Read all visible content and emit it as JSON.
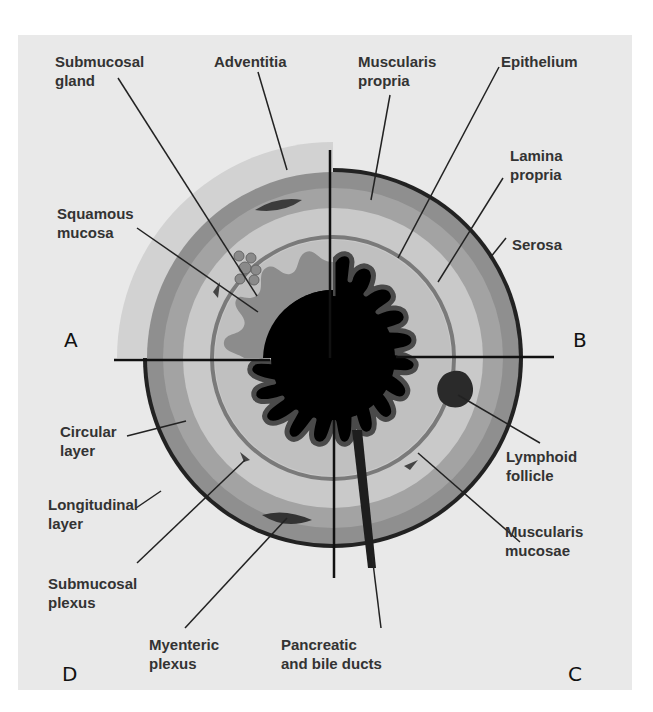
{
  "figure": {
    "quadrants": {
      "A": {
        "label": "A"
      },
      "B": {
        "label": "B"
      },
      "C": {
        "label": "C"
      },
      "D": {
        "label": "D"
      }
    },
    "labels": {
      "submucosal_gland": "Submucosal\ngland",
      "adventitia": "Adventitia",
      "muscularis_propria": "Muscularis\npropria",
      "epithelium": "Epithelium",
      "lamina_propria": "Lamina\npropria",
      "squamous_mucosa": "Squamous\nmucosa",
      "serosa": "Serosa",
      "circular_layer": "Circular\nlayer",
      "lymphoid_follicle": "Lymphoid\nfollicle",
      "longitudinal_layer": "Longitudinal\nlayer",
      "muscularis_mucosae": "Muscularis\nmucosae",
      "submucosal_plexus": "Submucosal\nplexus",
      "myenteric_plexus": "Myenteric\nplexus",
      "pancreatic_bile_ducts": "Pancreatic\nand bile ducts"
    },
    "colors": {
      "background": "#e9e9e9",
      "adventitia": "#d2d2d2",
      "longitudinal": "#8a8a8a",
      "circular": "#a6a6a6",
      "submucosa": "#c8c8c8",
      "muscularis_mucosae": "#7a7a7a",
      "lamina": "#bdbdbd",
      "squamous": "#8c8c8c",
      "lumen": "#000000",
      "serosa": "#222222"
    }
  }
}
